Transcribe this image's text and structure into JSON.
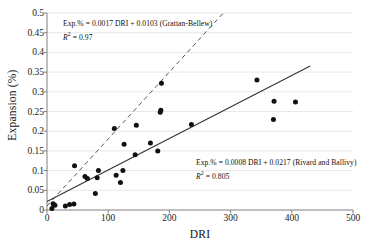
{
  "chart_data": {
    "type": "scatter",
    "title": "",
    "xlabel": "DRI",
    "ylabel": "Expansion (%)",
    "xlim": [
      0,
      500
    ],
    "ylim": [
      0,
      0.5
    ],
    "xticks": [
      0,
      100,
      200,
      300,
      400,
      500
    ],
    "yticks": [
      0,
      0.05,
      0.1,
      0.15,
      0.2,
      0.25,
      0.3,
      0.35,
      0.4,
      0.45,
      0.5
    ],
    "ytick_labels": [
      "0",
      "0.05",
      "0.1",
      "0.15",
      "0.2",
      "0.25",
      "0.3",
      "0.35",
      "0.4",
      "0.45",
      "0.5"
    ],
    "xtick_labels": [
      "0",
      "100",
      "200",
      "300",
      "400",
      "500"
    ],
    "grid": "horizontal",
    "legend": "none",
    "marker": "filled-circle",
    "marker_color": "#111111",
    "points": [
      {
        "x": 8,
        "y": 0.004
      },
      {
        "x": 10,
        "y": 0.016
      },
      {
        "x": 13,
        "y": 0.012
      },
      {
        "x": 30,
        "y": 0.01
      },
      {
        "x": 37,
        "y": 0.014
      },
      {
        "x": 44,
        "y": 0.015
      },
      {
        "x": 45,
        "y": 0.112
      },
      {
        "x": 62,
        "y": 0.085
      },
      {
        "x": 66,
        "y": 0.08
      },
      {
        "x": 79,
        "y": 0.042
      },
      {
        "x": 82,
        "y": 0.082
      },
      {
        "x": 84,
        "y": 0.1
      },
      {
        "x": 110,
        "y": 0.207
      },
      {
        "x": 113,
        "y": 0.088
      },
      {
        "x": 120,
        "y": 0.07
      },
      {
        "x": 124,
        "y": 0.1
      },
      {
        "x": 126,
        "y": 0.167
      },
      {
        "x": 144,
        "y": 0.14
      },
      {
        "x": 146,
        "y": 0.215
      },
      {
        "x": 169,
        "y": 0.17
      },
      {
        "x": 181,
        "y": 0.15
      },
      {
        "x": 185,
        "y": 0.248
      },
      {
        "x": 186,
        "y": 0.253
      },
      {
        "x": 187,
        "y": 0.322
      },
      {
        "x": 236,
        "y": 0.217
      },
      {
        "x": 343,
        "y": 0.33
      },
      {
        "x": 370,
        "y": 0.23
      },
      {
        "x": 371,
        "y": 0.276
      },
      {
        "x": 406,
        "y": 0.274
      }
    ],
    "trendlines": [
      {
        "name": "Grattan-Bellew",
        "style": "dashed",
        "color": "#555555",
        "slope": 0.0017,
        "intercept": 0.0103,
        "x_start": 0,
        "x_end": 288
      },
      {
        "name": "Rivard and Ballivy",
        "style": "solid",
        "color": "#333333",
        "slope": 0.0008,
        "intercept": 0.0217,
        "x_start": 0,
        "x_end": 430
      }
    ],
    "annotations": [
      {
        "id": "grattan-bellew",
        "equation": "Exp.% = 0.0017 DRI + 0.0103  (Grattan-Bellew)",
        "r2_label": "R",
        "r2_exponent": "2",
        "r2_value": "= 0.97"
      },
      {
        "id": "rivard-ballivy",
        "equation": "Exp.% = 0.0008 DRI + 0.0217 (Rivard and Ballivy)",
        "r2_label": "R",
        "r2_exponent": "2",
        "r2_value": "= 0.805"
      }
    ]
  },
  "colors": {
    "axis": "#808080",
    "grid": "#e8e8e8",
    "marker": "#111111",
    "dashed_line": "#555555",
    "solid_line": "#333333",
    "text": "#111111"
  }
}
